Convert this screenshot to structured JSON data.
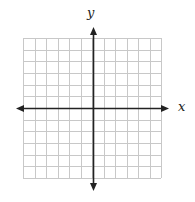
{
  "diagram": {
    "type": "coordinate-plane",
    "labels": {
      "x_axis": "x",
      "y_axis": "y"
    },
    "grid": {
      "columns": 12,
      "rows": 12,
      "left": 23,
      "top": 38,
      "right": 161,
      "bottom": 178,
      "origin_x": 93,
      "origin_y": 108,
      "line_color": "#c8c8c8"
    },
    "axes": {
      "color": "#222222",
      "x_arrow_left": 16,
      "x_arrow_right": 169,
      "y_arrow_top": 27,
      "y_arrow_bottom": 191
    }
  }
}
